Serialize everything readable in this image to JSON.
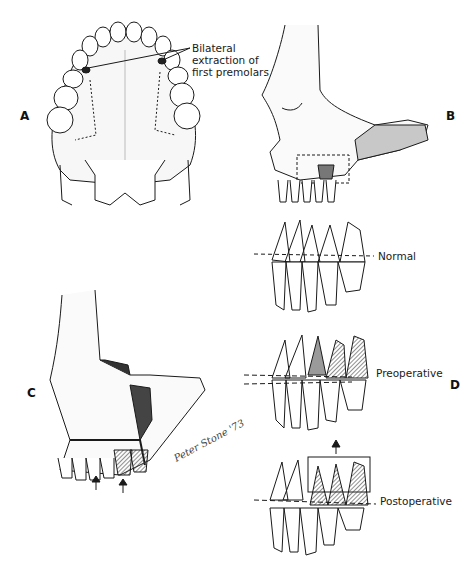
{
  "figure": {
    "panels": [
      {
        "id": "A",
        "label": "A",
        "description": "Occlusal view of maxilla with dotted outline of osteotomy; dark marks at first premolar sites"
      },
      {
        "id": "B",
        "label": "B",
        "description": "Lateral view of maxilla with dashed outline of posterior segment osteotomy"
      },
      {
        "id": "C",
        "label": "C",
        "description": "Oblique view of skull showing elevated posterior maxillary segment; arrows pointing upward"
      },
      {
        "id": "D",
        "label": "D",
        "description": "Dentition occlusal plane comparison: normal, preoperative, postoperative"
      }
    ],
    "annotations": {
      "panel_a_callout": [
        "Bilateral",
        "extraction of",
        "first premolars"
      ],
      "d_normal": "Normal",
      "d_preoperative": "Preoperative",
      "d_postoperative": "Postoperative"
    },
    "signature": "Peter Stone '73",
    "colors": {
      "line": "#1a1a1a",
      "shade_dark": "#555555",
      "shade_mid": "#9a9a9a",
      "background": "#ffffff"
    }
  }
}
